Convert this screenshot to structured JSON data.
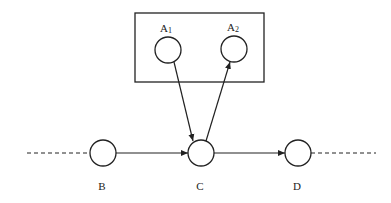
{
  "diagram": {
    "type": "directed-graph",
    "box": {
      "x": 135,
      "y": 13,
      "w": 129,
      "h": 69,
      "contains": [
        "A1",
        "A2"
      ]
    },
    "nodes": [
      {
        "id": "A1",
        "label": "A",
        "sub": "1",
        "cx": 168,
        "cy": 50,
        "r": 13,
        "lx": 166,
        "ly": 28
      },
      {
        "id": "A2",
        "label": "A",
        "sub": "2",
        "cx": 234,
        "cy": 49,
        "r": 13,
        "lx": 233,
        "ly": 27
      },
      {
        "id": "B",
        "label": "B",
        "sub": "",
        "cx": 103,
        "cy": 153,
        "r": 13,
        "lx": 102,
        "ly": 186
      },
      {
        "id": "C",
        "label": "C",
        "sub": "",
        "cx": 201,
        "cy": 153,
        "r": 13,
        "lx": 200,
        "ly": 186
      },
      {
        "id": "D",
        "label": "D",
        "sub": "",
        "cx": 298,
        "cy": 153,
        "r": 13,
        "lx": 297,
        "ly": 186
      }
    ],
    "edges": [
      {
        "from": "B",
        "to": "C",
        "x1": 116,
        "y1": 153,
        "x2": 188,
        "y2": 153
      },
      {
        "from": "C",
        "to": "D",
        "x1": 214,
        "y1": 153,
        "x2": 285,
        "y2": 153
      },
      {
        "from": "A1",
        "to": "C",
        "x1": 174,
        "y1": 62,
        "x2": 193,
        "y2": 141
      },
      {
        "from": "C",
        "to": "A2",
        "x1": 206,
        "y1": 141,
        "x2": 230,
        "y2": 62
      }
    ],
    "dashed": [
      {
        "x1": 27,
        "y1": 153,
        "x2": 90,
        "y2": 153
      },
      {
        "x1": 311,
        "y1": 153,
        "x2": 376,
        "y2": 153
      }
    ],
    "stroke": "#222222"
  }
}
